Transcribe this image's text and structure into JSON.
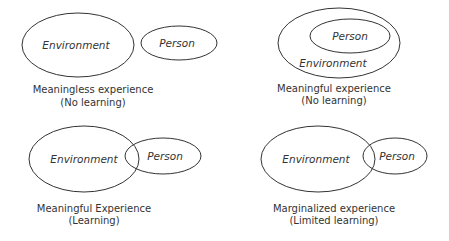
{
  "diagram": {
    "panels": [
      {
        "id": "meaningless",
        "environment_label": "Environment",
        "person_label": "Person",
        "relation": "separate",
        "caption_line1": "Meaningless experience",
        "caption_line2": "(No learning)"
      },
      {
        "id": "meaningful-no-learning",
        "environment_label": "Environment",
        "person_label": "Person",
        "relation": "person-inside-environment",
        "caption_line1": "Meaningful experience",
        "caption_line2": "(No learning)"
      },
      {
        "id": "meaningful-learning",
        "environment_label": "Environment",
        "person_label": "Person",
        "relation": "overlapping",
        "caption_line1": "Meaningful Experience",
        "caption_line2": "(Learning)"
      },
      {
        "id": "marginalized",
        "environment_label": "Environment",
        "person_label": "Person",
        "relation": "touching",
        "caption_line1": "Marginalized experience",
        "caption_line2": "(Limited learning)"
      }
    ],
    "colors": {
      "stroke": "#333333",
      "text": "#333333",
      "background": "#ffffff"
    }
  }
}
